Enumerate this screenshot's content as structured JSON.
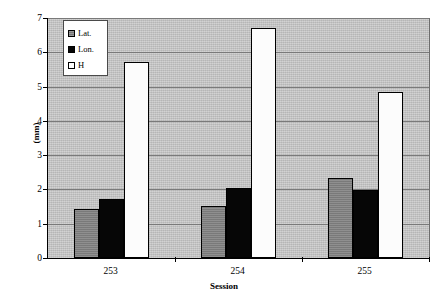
{
  "chart_data": {
    "type": "bar",
    "title": "",
    "xlabel": "Session",
    "ylabel": "(mm)",
    "categories": [
      "253",
      "254",
      "255"
    ],
    "series": [
      {
        "name": "Lat.",
        "color": "#808080",
        "values": [
          1.43,
          1.52,
          2.33
        ]
      },
      {
        "name": "Lon.",
        "color": "#060606",
        "values": [
          1.72,
          2.04,
          1.97
        ]
      },
      {
        "name": "H",
        "color": "#ffffff",
        "values": [
          5.71,
          6.71,
          4.84
        ]
      }
    ],
    "ylim": [
      0,
      7
    ],
    "ytick_labels": [
      "0",
      "1",
      "2",
      "3",
      "4",
      "5",
      "6",
      "7"
    ],
    "ytick_values": [
      0,
      1,
      2,
      3,
      4,
      5,
      6,
      7
    ],
    "grid": true,
    "legend_position": "upper-left-inside",
    "plot_background": "#c3c3c3",
    "axis_color": "#000000",
    "gridline_color": "#7a7a7a"
  },
  "legend": {
    "items": [
      {
        "label": "Lat."
      },
      {
        "label": "Lon."
      },
      {
        "label": "H"
      }
    ]
  },
  "axes": {
    "y_title": "(mm)",
    "x_title": "Session"
  }
}
